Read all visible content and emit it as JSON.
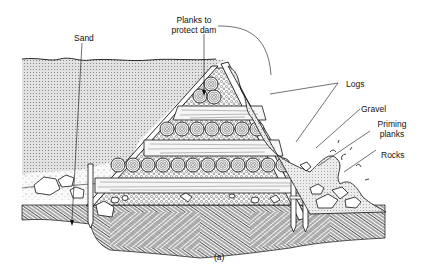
{
  "figure": {
    "caption": "(a)",
    "labels": {
      "sand": "Sand",
      "planks_line1": "Planks to",
      "planks_line2": "protect dam",
      "logs": "Logs",
      "gravel": "Gravel",
      "priming_line1": "Priming",
      "priming_line2": "planks",
      "rocks": "Rocks"
    }
  },
  "colors": {
    "ink": "#111111",
    "background": "#ffffff",
    "sand_fill": "#d9d9d9",
    "plank_fill": "#f4f4f4",
    "water_fill": "#e6e6e6"
  }
}
